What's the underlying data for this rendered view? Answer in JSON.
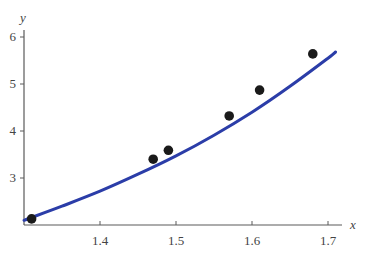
{
  "chart_data": {
    "type": "scatter",
    "title": "",
    "xlabel": "x",
    "ylabel": "y",
    "xlim": [
      1.3,
      1.72
    ],
    "ylim": [
      2.0,
      6.2
    ],
    "xticks": [
      1.4,
      1.5,
      1.6,
      1.7
    ],
    "yticks": [
      3,
      4,
      5,
      6
    ],
    "xtick_labels": [
      "1.4",
      "1.5",
      "1.6",
      "1.7"
    ],
    "ytick_labels": [
      "3",
      "4",
      "5",
      "6"
    ],
    "grid": false,
    "legend": null,
    "series": [
      {
        "name": "data points",
        "type": "scatter",
        "color": "#1a1a1a",
        "x": [
          1.31,
          1.47,
          1.49,
          1.57,
          1.61,
          1.68
        ],
        "y": [
          2.13,
          3.4,
          3.59,
          4.32,
          4.87,
          5.64
        ]
      },
      {
        "name": "fitted curve",
        "type": "line",
        "color": "#2b3da8",
        "x": [
          1.3,
          1.35,
          1.4,
          1.45,
          1.5,
          1.55,
          1.6,
          1.65,
          1.7,
          1.71
        ],
        "y": [
          2.1,
          2.4,
          2.72,
          3.08,
          3.47,
          3.91,
          4.4,
          4.95,
          5.55,
          5.68
        ]
      }
    ]
  },
  "labels": {
    "x_axis": "x",
    "y_axis": "y"
  }
}
